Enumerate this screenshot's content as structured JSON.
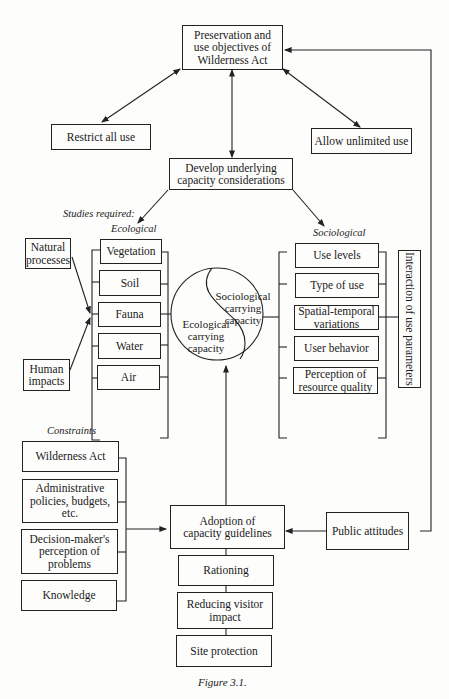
{
  "diagram": {
    "top": {
      "objectives": "Preservation and\nuse objectives of\nWilderness Act",
      "restrict": "Restrict all use",
      "allow": "Allow unlimited use",
      "develop": "Develop underlying\ncapacity considerations"
    },
    "studies_label": "Studies required:",
    "ecological": {
      "heading": "Ecological",
      "items": [
        "Vegetation",
        "Soil",
        "Fauna",
        "Water",
        "Air"
      ],
      "inputs": [
        "Natural\nprocesses",
        "Human\nimpacts"
      ]
    },
    "sociological": {
      "heading": "Sociological",
      "items": [
        "Use levels",
        "Type of use",
        "Spatial-temporal\nvariations",
        "User behavior",
        "Perception of\nresource quality"
      ],
      "interaction": "Interaction of use parameters"
    },
    "circle": {
      "sociological": "Sociological\ncarrying\ncapacity",
      "ecological": "Ecological\ncarrying\ncapacity"
    },
    "constraints": {
      "heading": "Constraints",
      "items": [
        "Wilderness Act",
        "Administrative\npolicies, budgets,\netc.",
        "Decision-maker's\nperception of\nproblems",
        "Knowledge"
      ]
    },
    "adoption": "Adoption of\ncapacity guidelines",
    "public": "Public attitudes",
    "outcomes": [
      "Rationing",
      "Reducing visitor\nimpact",
      "Site protection"
    ],
    "caption": "Figure 3.1."
  }
}
